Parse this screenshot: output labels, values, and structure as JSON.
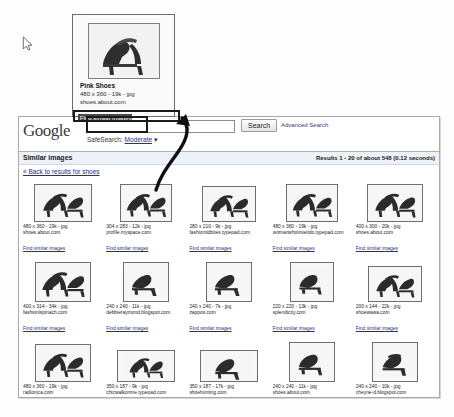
{
  "cursor": {
    "icon": "mouse-pointer-icon"
  },
  "hovercard": {
    "title": "Pink Shoes",
    "meta": "480 x 360 - 19k - jpg",
    "site": "shoes.about.com",
    "link": "Find similar images",
    "thumb_alt": "pink high heel shoe thumbnail"
  },
  "browser": {
    "header": {
      "logo": "Google",
      "search_value": "",
      "search_placeholder": "",
      "search_button": "Search",
      "advanced_link": "Advanced Search",
      "safesearch_label": "SafeSearch:",
      "safesearch_value": "Moderate",
      "safesearch_caret": "▾"
    },
    "strip": {
      "title": "Similar images",
      "results": "Results 1 - 20 of about 548 (0.12 seconds)"
    },
    "back_link": "« Back to results for shoes",
    "find_similar_label": "Find similar images",
    "results": [
      {
        "dimensions": "480 x 360 - 19k - jpg",
        "site": "shoes.about.com",
        "thumb_w": 58,
        "thumb_h": 38,
        "shoe": "pair-heels-a"
      },
      {
        "dimensions": "304 x 283 - 12k - jpg",
        "site": "profile.myspace.com",
        "thumb_w": 52,
        "thumb_h": 38,
        "shoe": "pair-heels-b"
      },
      {
        "dimensions": "280 x 210 - 9k - jpg",
        "site": "fashiontidbites.typepad.com",
        "thumb_w": 54,
        "thumb_h": 36,
        "shoe": "pair-pumps-a"
      },
      {
        "dimensions": "480 x 360 - 19k - jpg",
        "site": "womanwholoveitdo.typepad.com",
        "thumb_w": 52,
        "thumb_h": 38,
        "shoe": "pair-pumps-b"
      },
      {
        "dimensions": "400 x 300 - 20k - jpg",
        "site": "shoes.about.com",
        "thumb_w": 56,
        "thumb_h": 38,
        "shoe": "pair-heels-c"
      },
      {
        "dimensions": "400 x 314 - 34k - jpg",
        "site": "fashionispinach.com",
        "thumb_w": 56,
        "thumb_h": 40,
        "shoe": "pair-heels-d"
      },
      {
        "dimensions": "240 x 240 - 11k - jpg",
        "site": "debbieraymond.blogspot.com",
        "thumb_w": 46,
        "thumb_h": 40,
        "shoe": "single-heel-a"
      },
      {
        "dimensions": "240 x 240 - 7k - jpg",
        "site": "zappos.com",
        "thumb_w": 46,
        "thumb_h": 40,
        "shoe": "single-heel-b"
      },
      {
        "dimensions": "220 x 220 - 13k - jpg",
        "site": "splendicity.com",
        "thumb_w": 44,
        "thumb_h": 40,
        "shoe": "single-pump-a"
      },
      {
        "dimensions": "200 x 144 - 22k - jpg",
        "site": "shoewawa.com",
        "thumb_w": 54,
        "thumb_h": 36,
        "shoe": "pair-sandal-a"
      },
      {
        "dimensions": "480 x 360 - 19k - jpg",
        "site": "radionica.com",
        "thumb_w": 56,
        "thumb_h": 38,
        "shoe": "pair-heels-e"
      },
      {
        "dimensions": "350 x 187 - 9k - jpg",
        "site": "chicwalkonme.typepad.com",
        "thumb_w": 58,
        "thumb_h": 32,
        "shoe": "pair-flats-a"
      },
      {
        "dimensions": "350 x 187 - 17k - jpg",
        "site": "shoehunting.com",
        "thumb_w": 58,
        "thumb_h": 32,
        "shoe": "single-heel-c"
      },
      {
        "dimensions": "240 x 240 - 11k - jpg",
        "site": "shoes.about.com",
        "thumb_w": 46,
        "thumb_h": 40,
        "shoe": "single-pump-b"
      },
      {
        "dimensions": "240 x 240 - 10k - jpg",
        "site": "cheyne-d.blogspot.com",
        "thumb_w": 46,
        "thumb_h": 40,
        "shoe": "single-sandal-a"
      }
    ]
  },
  "colors": {
    "link": "#2a2a8c",
    "annotation": "#1a1a1a",
    "strip_bg": "#eef1f6",
    "highlight_bg": "#4a4a4a"
  }
}
